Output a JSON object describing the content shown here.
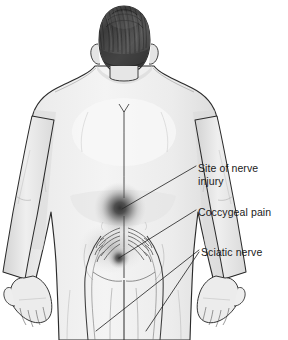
{
  "figure": {
    "view": "posterior",
    "background_color": "#ffffff",
    "body_fill_color": "#ededed",
    "outline_color": "#2b2b2b",
    "hair_color": "#3a3a3a",
    "pain_blob_color": "#3d3d3d",
    "leader_line_color": "#2b2b2b",
    "label_text_color": "#1a1a1a"
  },
  "labels": [
    {
      "id": "site-of-nerve-injury",
      "text": "Site of nerve\ninjury",
      "line1": "Site of nerve",
      "line2": "injury",
      "anchor_x": 122,
      "anchor_y": 209
    },
    {
      "id": "coccygeal-pain",
      "text": "Coccygeal pain",
      "line1": "Coccygeal pain",
      "line2": "",
      "anchor_x": 119,
      "anchor_y": 258
    },
    {
      "id": "sciatic-nerve",
      "text": "Sciatic nerve",
      "line1": "Sciatic nerve",
      "line2": "",
      "anchor_x": 96,
      "anchor_y": 331
    }
  ],
  "anatomy": {
    "head": "head-posterior",
    "hair": "hair-textured",
    "spine": "spine-midline",
    "pain_sites": [
      {
        "name": "lumbar-nerve-injury-blob",
        "cx": 120,
        "cy": 208,
        "r": 22
      },
      {
        "name": "coccygeal-pain-blob",
        "cx": 119,
        "cy": 258,
        "r": 9
      }
    ],
    "nerves": [
      "sacral-rootlets-left",
      "sacral-rootlets-right",
      "sciatic-nerve-left",
      "sciatic-nerve-right"
    ],
    "limbs": [
      "arm-left",
      "arm-right",
      "hand-left",
      "hand-right",
      "leg-left",
      "leg-right"
    ]
  }
}
